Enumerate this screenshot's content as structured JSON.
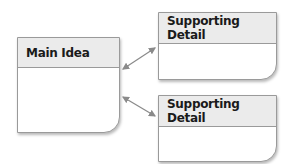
{
  "diagram": {
    "main": {
      "title": "Main Idea"
    },
    "details": [
      {
        "title": "Supporting Detail"
      },
      {
        "title": "Supporting Detail"
      }
    ],
    "colors": {
      "border": "#9a9a9a",
      "header_bg": "#ebebeb",
      "arrow": "#8a8a8a"
    }
  }
}
